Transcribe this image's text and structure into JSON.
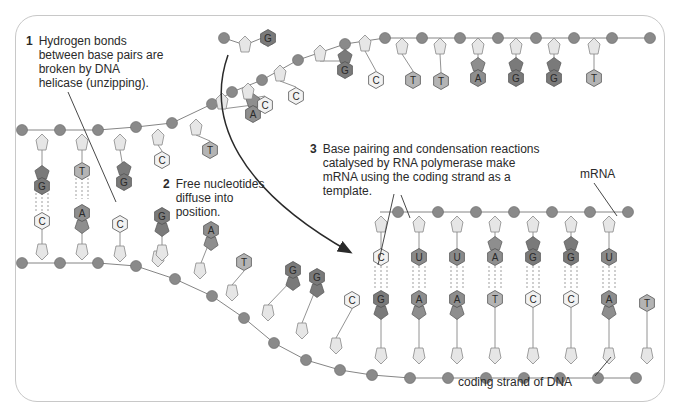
{
  "colors": {
    "phosphate": "#8a8a8a",
    "sugar": "#e6e6e6",
    "base_G": "#7a7a7a",
    "base_A": "#8e8e8e",
    "base_T": "#b4b4b4",
    "base_U": "#8a8a8a",
    "base_C": "#f2f2f2",
    "line": "#555555",
    "text": "#2a2a2a"
  },
  "labels": {
    "step1": {
      "number": "1",
      "text": "Hydrogen bonds between base pairs are broken by DNA helicase (unzipping)."
    },
    "step2": {
      "number": "2",
      "text": "Free nucleotides diffuse into position."
    },
    "step3": {
      "number": "3",
      "text": "Base pairing and condensation reactions catalysed by RNA polymerase make mRNA using the coding strand as a template."
    },
    "mrna": "mRNA",
    "coding_strand": "coding strand of DNA"
  },
  "strands": {
    "top_dna_left_bases": [
      "G",
      "T",
      "G",
      "C",
      "T"
    ],
    "bottom_dna_left_bases": [
      "C",
      "A",
      "C"
    ],
    "separated_top_strand_bases": [
      "A",
      "C",
      "C",
      "G",
      "C",
      "T",
      "T",
      "A",
      "G",
      "G",
      "T"
    ],
    "free_nucleotide": "G",
    "free_nucleotides_step2": [
      "G",
      "A"
    ],
    "coding_strand_bases_diagonal": [
      "T",
      "G",
      "G",
      "C"
    ],
    "mrna_bases": [
      "C",
      "U",
      "U",
      "A",
      "G",
      "G",
      "U"
    ],
    "coding_strand_paired_bases": [
      "G",
      "A",
      "A",
      "T",
      "C",
      "C",
      "A",
      "T"
    ]
  }
}
